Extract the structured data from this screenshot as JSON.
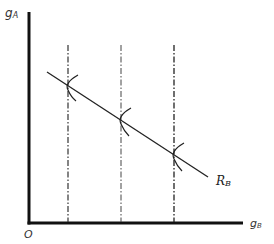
{
  "diagram": {
    "y_axis_label": "g",
    "y_axis_sub": "A",
    "x_axis_label": "g",
    "x_axis_sub": "B",
    "origin_label": "O",
    "line_label": "R",
    "line_sub": "B",
    "colors": {
      "axis": "#111111",
      "line": "#222222",
      "guide": "#333333"
    },
    "axes": {
      "origin": [
        29,
        223
      ],
      "y_top": 12,
      "x_right": 243
    },
    "reaction_line": {
      "start": [
        47,
        72
      ],
      "end": [
        208,
        177
      ]
    },
    "guides": [
      {
        "x": 68,
        "y_top": 45,
        "intersect_y": 85
      },
      {
        "x": 121,
        "y_top": 45,
        "intersect_y": 120
      },
      {
        "x": 174,
        "y_top": 45,
        "intersect_y": 154
      }
    ]
  }
}
